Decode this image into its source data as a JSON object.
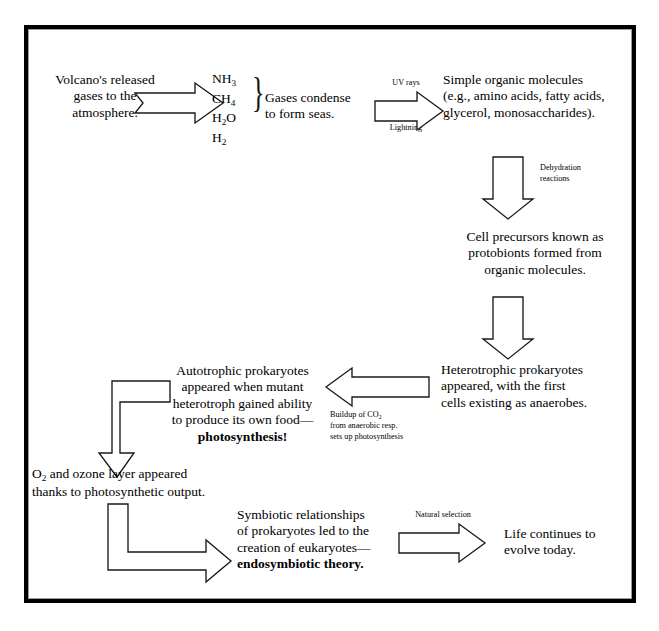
{
  "diagram": {
    "border_color": "#000000",
    "background": "#ffffff",
    "nodes": {
      "volcano": "Volcano's released\ngases to the\natmosphere.",
      "gases_formula": [
        "NH3",
        "CH4",
        "H2O",
        "H2"
      ],
      "condense": "Gases condense\nto form seas.",
      "organic": "Simple organic molecules\n(e.g., amino acids, fatty acids,\nglycerol, monosaccharides).",
      "protobionts": "Cell precursors known as\nprotobionts formed from\norganic molecules.",
      "heterotrophs": "Heterotrophic prokaryotes\nappeared, with the first\ncells existing as anaerobes.",
      "autotrophs": "Autotrophic prokaryotes\nappeared when mutant\nheterotroph gained ability\nto produce its own food—",
      "autotrophs_bold": "photosynthesis!",
      "ozone": "O2 and ozone layer appeared\nthanks to photosynthetic output.",
      "symbiosis": "Symbiotic relationships\nof prokaryotes led to the\ncreation of eukaryotes—",
      "symbiosis_bold": "endosymbiotic theory.",
      "life_today": "Life continues to\nevolve today."
    },
    "arrow_labels": {
      "uv_rays": "UV rays",
      "lightning": "Lightning",
      "dehydration": "Dehydration\nreactions",
      "co2_buildup": "Buildup of CO2\nfrom anaerobic resp.\nsets up photosynthesis",
      "natural_selection": "Natural selection"
    },
    "arrows": [
      {
        "name": "volcano-to-gases",
        "direction": "right"
      },
      {
        "name": "seas-to-organic",
        "direction": "right"
      },
      {
        "name": "organic-to-protobionts",
        "direction": "down"
      },
      {
        "name": "protobionts-to-heterotrophs",
        "direction": "down"
      },
      {
        "name": "heterotrophs-to-autotrophs",
        "direction": "left"
      },
      {
        "name": "autotrophs-to-ozone",
        "direction": "elbow-down"
      },
      {
        "name": "ozone-to-symbiosis",
        "direction": "elbow-right"
      },
      {
        "name": "symbiosis-to-life",
        "direction": "right"
      }
    ]
  }
}
